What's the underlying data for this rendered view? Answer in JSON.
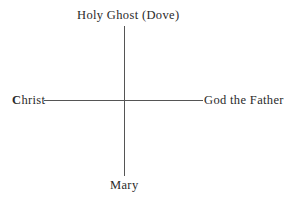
{
  "diagram": {
    "type": "cross",
    "nodes": {
      "top": "Holy Ghost (Dove)",
      "left": "Christ",
      "right": "God the Father",
      "bottom": "Mary"
    },
    "edges": [
      {
        "from": "top",
        "to": "bottom",
        "orientation": "vertical"
      },
      {
        "from": "left",
        "to": "right",
        "orientation": "horizontal"
      }
    ],
    "colors": {
      "text": "#2a2a2a",
      "line": "#555555",
      "background": "#ffffff"
    }
  }
}
